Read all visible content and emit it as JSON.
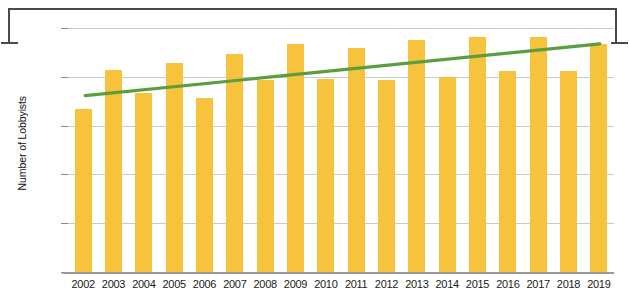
{
  "chart_data": {
    "type": "bar",
    "title": "",
    "xlabel": "",
    "ylabel": "Number of Lobbyists",
    "ylim": [
      0,
      2000
    ],
    "ytick_labels": [
      "0",
      "400",
      "800",
      "1,200",
      "1,600",
      "2,000"
    ],
    "ytick_values": [
      0,
      400,
      800,
      1200,
      1600,
      2000
    ],
    "grid": true,
    "legend": "none",
    "bar_color": "#F7C33D",
    "trendline_color": "#5B9E3F",
    "categories": [
      "2002",
      "2003",
      "2004",
      "2005",
      "2006",
      "2007",
      "2008",
      "2009",
      "2010",
      "2011",
      "2012",
      "2013",
      "2014",
      "2015",
      "2016",
      "2017",
      "2018",
      "2019"
    ],
    "values": [
      1340,
      1655,
      1470,
      1710,
      1430,
      1790,
      1570,
      1870,
      1580,
      1840,
      1570,
      1900,
      1600,
      1930,
      1650,
      1930,
      1645,
      1870
    ],
    "series": [
      {
        "name": "Number of Lobbyists",
        "type": "bar",
        "values": [
          1340,
          1655,
          1470,
          1710,
          1430,
          1790,
          1570,
          1870,
          1580,
          1840,
          1570,
          1900,
          1600,
          1930,
          1650,
          1930,
          1645,
          1870
        ]
      },
      {
        "name": "Trendline",
        "type": "line",
        "x": [
          "2002",
          "2019"
        ],
        "values": [
          1445,
          1870
        ]
      }
    ]
  },
  "frame": {
    "color": "#4a4a4a"
  }
}
